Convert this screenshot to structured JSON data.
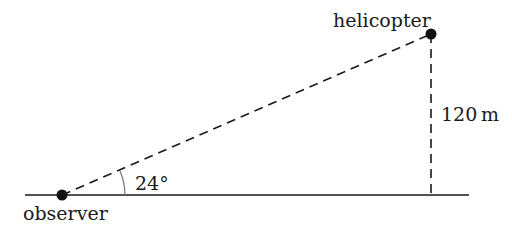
{
  "diagram": {
    "type": "right-triangle-elevation",
    "labels": {
      "observer": "observer",
      "helicopter": "helicopter",
      "height": "120 m",
      "angle": "24°"
    },
    "points": {
      "observer": {
        "x": 62,
        "y": 195
      },
      "helicopter": {
        "x": 431,
        "y": 34
      },
      "foot": {
        "x": 431,
        "y": 195
      }
    },
    "values": {
      "angle_of_elevation_deg": 24,
      "height_m": 120
    },
    "colors": {
      "line": "#1a1a1a",
      "arc": "#777777",
      "background": "#ffffff"
    }
  }
}
